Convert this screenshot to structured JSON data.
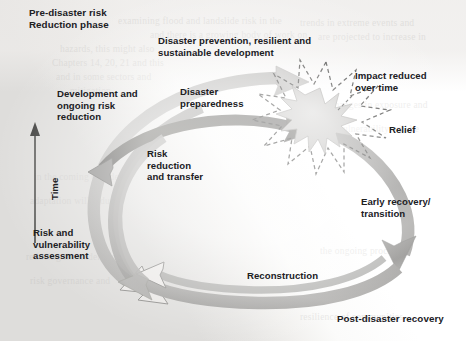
{
  "figure": {
    "phase_top_left": "Pre-disaster risk\nReduction phase",
    "phase_bottom_right": "Post-disaster recovery",
    "axis_label": "Time"
  },
  "labels": {
    "development": "Development and\nongoing risk\nreduction",
    "prevention": "Disaster prevention, resilient and\nsustainable development",
    "preparedness": "Disaster\npreparedness",
    "risk_reduction": "Risk\nreduction\nand transfer",
    "risk_assessment": "Risk and\nvulnerability\nassessment",
    "impact_reduced": "Impact reduced\nover time",
    "relief": "Relief",
    "early_recovery": "Early recovery/\ntransition",
    "reconstruction": "Reconstruction"
  },
  "ghost_text": [
    "examining flood and landslide risk in the",
    "and there is a growing body of work on",
    "hazards, this might also",
    "Chapters 14, 20, 21 and this",
    "and in some sectors and",
    "mitigation",
    "trends in extreme events and",
    "are projected to increase in",
    "changes in exposure and",
    "vulnerability will be",
    "in the coming decades",
    "adaptation will reduce",
    "reducing the underlying",
    "risk governance and",
    "the ongoing process of",
    "resilience of communities"
  ],
  "colors": {
    "arc_light": "#b9b8b6",
    "arc_mid": "#9d9c9a",
    "arc_dark": "#6f6e6c",
    "burst_fill": "#c9c8c6",
    "burst_stroke": "#4a4a48",
    "text": "#20201f",
    "paper": "#fcfcfb",
    "band": "#dedddb"
  }
}
